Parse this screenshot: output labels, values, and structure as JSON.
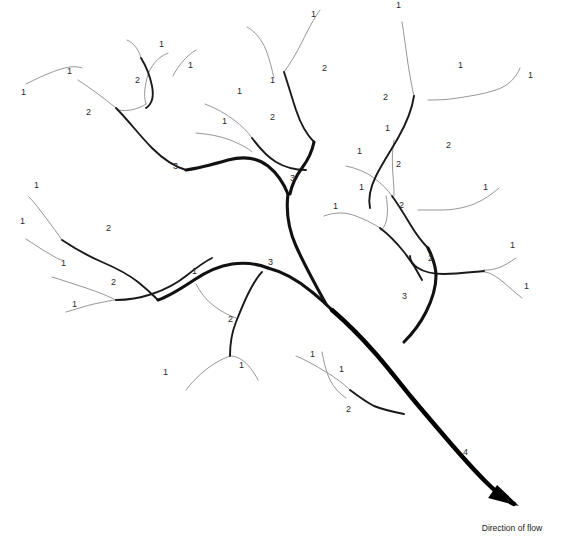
{
  "diagram": {
    "background_color": "#ffffff",
    "caption": {
      "text": "Direction of flow",
      "x": 512,
      "y": 531
    },
    "stroke_colors": {
      "order1": "#8a8a8a",
      "order2": "#1a1a1a",
      "order3": "#111111",
      "order4": "#000000"
    },
    "stroke_widths": {
      "order1": 0.9,
      "order2": 1.9,
      "order3": 3.1,
      "order4": 4.4
    },
    "arrow": {
      "tip_x": 519,
      "tip_y": 506
    },
    "labels": [
      {
        "text": "1",
        "x": 21,
        "y": 95
      },
      {
        "text": "1",
        "x": 67,
        "y": 74
      },
      {
        "text": "2",
        "x": 86,
        "y": 115
      },
      {
        "text": "2",
        "x": 135,
        "y": 83
      },
      {
        "text": "1",
        "x": 159,
        "y": 47
      },
      {
        "text": "1",
        "x": 188,
        "y": 68
      },
      {
        "text": "3",
        "x": 173,
        "y": 169
      },
      {
        "text": "1",
        "x": 270,
        "y": 83
      },
      {
        "text": "1",
        "x": 311,
        "y": 17
      },
      {
        "text": "2",
        "x": 322,
        "y": 71
      },
      {
        "text": "1",
        "x": 237,
        "y": 94
      },
      {
        "text": "1",
        "x": 222,
        "y": 124
      },
      {
        "text": "2",
        "x": 270,
        "y": 120
      },
      {
        "text": "3",
        "x": 290,
        "y": 181
      },
      {
        "text": "1",
        "x": 396,
        "y": 8
      },
      {
        "text": "1",
        "x": 458,
        "y": 68
      },
      {
        "text": "1",
        "x": 528,
        "y": 78
      },
      {
        "text": "2",
        "x": 383,
        "y": 100
      },
      {
        "text": "1",
        "x": 385,
        "y": 131
      },
      {
        "text": "2",
        "x": 446,
        "y": 148
      },
      {
        "text": "2",
        "x": 396,
        "y": 167
      },
      {
        "text": "1",
        "x": 357,
        "y": 154
      },
      {
        "text": "1",
        "x": 359,
        "y": 190
      },
      {
        "text": "1",
        "x": 333,
        "y": 209
      },
      {
        "text": "2",
        "x": 399,
        "y": 208
      },
      {
        "text": "1",
        "x": 483,
        "y": 190
      },
      {
        "text": "2",
        "x": 428,
        "y": 261
      },
      {
        "text": "1",
        "x": 510,
        "y": 248
      },
      {
        "text": "1",
        "x": 524,
        "y": 289
      },
      {
        "text": "3",
        "x": 402,
        "y": 299
      },
      {
        "text": "1",
        "x": 34,
        "y": 188
      },
      {
        "text": "1",
        "x": 20,
        "y": 224
      },
      {
        "text": "2",
        "x": 106,
        "y": 231
      },
      {
        "text": "1",
        "x": 61,
        "y": 266
      },
      {
        "text": "2",
        "x": 111,
        "y": 285
      },
      {
        "text": "1",
        "x": 72,
        "y": 307
      },
      {
        "text": "3",
        "x": 268,
        "y": 265
      },
      {
        "text": "1",
        "x": 192,
        "y": 274
      },
      {
        "text": "2",
        "x": 228,
        "y": 322
      },
      {
        "text": "1",
        "x": 163,
        "y": 375
      },
      {
        "text": "1",
        "x": 239,
        "y": 368
      },
      {
        "text": "1",
        "x": 310,
        "y": 357
      },
      {
        "text": "1",
        "x": 339,
        "y": 372
      },
      {
        "text": "2",
        "x": 346,
        "y": 412
      },
      {
        "text": "4",
        "x": 463,
        "y": 455
      }
    ],
    "streams": [
      {
        "name": "order1-far-nw-tip",
        "order": 1,
        "d": "M 26,84 C 34,80 46,74 58,70 C 70,66 76,66 82,68"
      },
      {
        "name": "order1-nw-upper",
        "order": 1,
        "d": "M 78,80 C 90,88 104,98 116,108"
      },
      {
        "name": "order1-nw-hook",
        "order": 1,
        "d": "M 168,53 C 158,57 150,66 147,78 C 144,90 144,98 146,104"
      },
      {
        "name": "order1-nw-hook-join",
        "order": 1,
        "d": "M 146,104 C 140,108 130,112 118,110"
      },
      {
        "name": "order2-nw-main",
        "order": 2,
        "d": "M 116,108 C 128,120 140,136 152,148 C 164,160 176,167 186,170"
      },
      {
        "name": "order1-n-left-tip",
        "order": 1,
        "d": "M 127,40 C 134,43 139,50 141,58"
      },
      {
        "name": "order1-n-right-tip",
        "order": 1,
        "d": "M 196,50 C 186,56 178,66 173,76"
      },
      {
        "name": "order2-n-upper",
        "order": 2,
        "d": "M 141,58 C 146,66 150,76 152,86 C 154,96 152,104 146,108"
      },
      {
        "name": "order1-nc-left",
        "order": 1,
        "d": "M 247,27 C 255,31 262,40 266,50 C 270,60 272,70 274,78"
      },
      {
        "name": "order1-nc-right",
        "order": 1,
        "d": "M 320,10 C 314,18 308,30 302,42 C 296,54 290,64 284,72"
      },
      {
        "name": "order2-nc-stem",
        "order": 2,
        "d": "M 284,72 C 288,84 292,98 296,110 C 300,122 306,134 314,142"
      },
      {
        "name": "order1-mid-left-upper",
        "order": 1,
        "d": "M 205,104 C 216,108 226,114 234,120 C 242,126 248,132 252,138"
      },
      {
        "name": "order1-mid-left-lower",
        "order": 1,
        "d": "M 196,133 C 208,134 220,136 230,140 C 240,144 248,148 252,152"
      },
      {
        "name": "order2-mid-left",
        "order": 2,
        "d": "M 252,138 C 258,146 266,156 276,162 C 286,168 296,170 306,170"
      },
      {
        "name": "order3-upper-trunk",
        "order": 3,
        "d": "M 186,170 C 200,168 214,164 228,160 C 244,156 258,158 268,166 C 278,174 284,184 288,194"
      },
      {
        "name": "order3-nc-down",
        "order": 3,
        "d": "M 314,142 C 312,152 308,160 302,168 C 296,176 292,184 290,194"
      },
      {
        "name": "order3-descend",
        "order": 3,
        "d": "M 288,194 C 286,210 288,228 296,246 C 304,264 316,286 326,304"
      },
      {
        "name": "order1-ne-left-tip",
        "order": 1,
        "d": "M 402,22 C 404,34 406,50 408,64 C 410,76 412,88 414,96"
      },
      {
        "name": "order1-ne-right-tip",
        "order": 1,
        "d": "M 520,68 C 516,78 508,86 496,90 C 484,94 470,96 458,98 C 446,100 436,100 428,100"
      },
      {
        "name": "order2-ne-stem",
        "order": 2,
        "d": "M 414,96 C 412,110 406,124 398,138 C 390,152 382,164 376,176 C 370,188 368,198 370,208"
      },
      {
        "name": "order1-ne-mid-right",
        "order": 1,
        "d": "M 499,188 C 492,194 484,200 474,204 C 464,208 452,210 442,210 C 432,210 424,210 418,210"
      },
      {
        "name": "order1-mid2-left",
        "order": 1,
        "d": "M 346,166 C 356,168 366,172 374,178 C 382,184 388,190 392,196"
      },
      {
        "name": "order1-mid2-up",
        "order": 1,
        "d": "M 394,140 C 392,152 392,164 393,176 C 394,186 394,192 394,196"
      },
      {
        "name": "order2-mid2",
        "order": 2,
        "d": "M 392,196 C 398,204 404,214 410,224 C 416,234 422,242 428,248"
      },
      {
        "name": "order1-low-left-arc",
        "order": 1,
        "d": "M 324,216 C 334,212 346,212 356,216 C 366,220 374,224 380,228"
      },
      {
        "name": "order1-low-left-hook",
        "order": 1,
        "d": "M 386,196 C 388,206 388,214 386,222 C 384,228 382,230 380,230"
      },
      {
        "name": "order2-low-left",
        "order": 2,
        "d": "M 380,228 C 388,234 396,242 404,252 C 412,262 418,272 422,280"
      },
      {
        "name": "order3-right-trunk",
        "order": 3,
        "d": "M 428,248 C 432,256 436,266 436,276 C 436,288 432,300 426,312 C 420,324 412,334 404,342"
      },
      {
        "name": "order1-e-right-tip1",
        "order": 1,
        "d": "M 516,258 C 510,262 504,266 498,268 C 492,270 488,270 484,270"
      },
      {
        "name": "order1-e-right-tip2",
        "order": 1,
        "d": "M 522,298 C 514,292 506,284 498,278 C 492,274 488,272 484,272"
      },
      {
        "name": "order2-e-branch",
        "order": 2,
        "d": "M 484,271 C 472,272 458,274 444,274 C 432,274 424,272 418,268 C 412,264 410,260 410,256"
      },
      {
        "name": "order1-sw-tip1",
        "order": 1,
        "d": "M 29,197 C 34,202 40,210 46,218 C 52,226 58,234 62,240"
      },
      {
        "name": "order1-sw-tip2",
        "order": 1,
        "d": "M 26,239 C 34,244 42,250 50,254 C 56,258 60,260 62,260"
      },
      {
        "name": "order2-sw-main",
        "order": 2,
        "d": "M 62,240 C 74,248 88,256 102,262 C 116,268 128,274 138,282 C 148,290 154,296 158,300"
      },
      {
        "name": "order1-sw2-tip1",
        "order": 1,
        "d": "M 52,277 C 62,280 74,284 86,288 C 98,292 108,296 116,300"
      },
      {
        "name": "order1-sw2-tip2",
        "order": 1,
        "d": "M 66,312 C 74,310 84,306 94,304 C 104,302 112,300 116,300"
      },
      {
        "name": "order2-sw2-main",
        "order": 2,
        "d": "M 116,300 C 128,300 140,298 152,294 C 164,290 176,284 186,276 C 196,268 204,262 212,258"
      },
      {
        "name": "order1-s-hook",
        "order": 1,
        "d": "M 196,284 C 200,292 206,300 214,306 C 222,312 230,316 236,318"
      },
      {
        "name": "order3-sw-trunk",
        "order": 3,
        "d": "M 158,300 C 170,296 182,288 194,280 C 206,272 218,266 232,264 C 246,262 258,264 268,268"
      },
      {
        "name": "order3-sw-to-main",
        "order": 3,
        "d": "M 268,268 C 284,272 300,282 312,292 C 322,300 328,306 332,310"
      },
      {
        "name": "order1-sc-tip1",
        "order": 1,
        "d": "M 186,390 C 192,382 200,374 208,368 C 216,362 224,358 230,356"
      },
      {
        "name": "order1-sc-tip2",
        "order": 1,
        "d": "M 258,380 C 254,372 248,364 242,360 C 236,356 232,356 230,356"
      },
      {
        "name": "order2-sc-stem",
        "order": 2,
        "d": "M 230,356 C 230,344 232,332 236,322 C 240,312 244,302 248,294 C 252,286 256,278 262,272"
      },
      {
        "name": "order1-s-bottom-left",
        "order": 1,
        "d": "M 296,356 C 306,360 316,366 326,372 C 336,378 344,384 350,390"
      },
      {
        "name": "order1-s-bottom-hook",
        "order": 1,
        "d": "M 322,352 C 324,362 326,372 330,380 C 334,388 340,394 346,398"
      },
      {
        "name": "order2-s-bottom",
        "order": 2,
        "d": "M 350,390 C 358,396 366,402 374,406 C 384,410 394,412 404,414"
      },
      {
        "name": "order4-main-trunk",
        "order": 4,
        "d": "M 332,310 C 346,322 362,338 376,354 C 390,370 402,386 412,398 C 422,410 434,424 446,438 C 458,452 472,468 486,482 C 496,492 506,500 514,504"
      }
    ]
  }
}
